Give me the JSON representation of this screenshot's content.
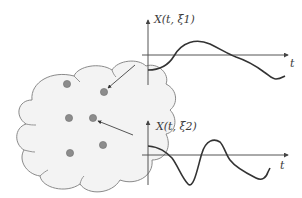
{
  "diagram": {
    "colors": {
      "cloud_fill": "#f3f3f3",
      "cloud_stroke": "#8a8a8a",
      "dot_fill": "#8c8c8c",
      "dot_stroke": "#6f6f6f",
      "axis": "#555555",
      "curve": "#333333",
      "arrow": "#555555"
    },
    "sample_space": {
      "shape": "cloud",
      "outcomes": [
        {
          "x": 67,
          "y": 84
        },
        {
          "x": 104,
          "y": 92
        },
        {
          "x": 69,
          "y": 118
        },
        {
          "x": 93,
          "y": 118
        },
        {
          "x": 70,
          "y": 153
        },
        {
          "x": 103,
          "y": 145
        }
      ]
    },
    "plots": [
      {
        "label": "X(t, ξ1)",
        "axis_label_t": "t",
        "mapped_from_outcome": 1
      },
      {
        "label": "X(t, ξ2)",
        "axis_label_t": "t",
        "mapped_from_outcome": 3
      }
    ]
  }
}
